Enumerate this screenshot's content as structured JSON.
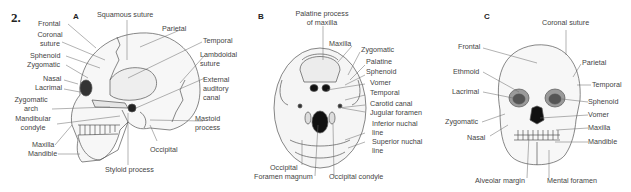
{
  "figure_number": "2.",
  "panels": {
    "A": {
      "letter": "A",
      "labels": {
        "squamous_suture": "Squamous suture",
        "frontal": "Frontal",
        "coronal_suture_1": "Coronal",
        "coronal_suture_2": "suture",
        "parietal": "Parietal",
        "temporal": "Temporal",
        "sphenoid": "Sphenoid",
        "zygomatic": "Zygomatic",
        "lambdoidal_1": "Lambdoidal",
        "lambdoidal_2": "suture",
        "nasal": "Nasal",
        "lacrimal": "Lacrimal",
        "external_1": "External",
        "external_2": "auditory",
        "external_3": "canal",
        "zyg_arch_1": "Zygomatic",
        "zyg_arch_2": "arch",
        "mand_condyle_1": "Mandibular",
        "mand_condyle_2": "condyle",
        "mastoid_1": "Mastoid",
        "mastoid_2": "process",
        "maxilla": "Maxilla",
        "mandible": "Mandible",
        "occipital": "Occipital",
        "styloid": "Styloid process"
      }
    },
    "B": {
      "letter": "B",
      "labels": {
        "palatine_process_1": "Palatine process",
        "palatine_process_2": "of maxilla",
        "maxilla": "Maxilla",
        "zygomatic": "Zygomatic",
        "palatine": "Palatine",
        "sphenoid": "Sphenoid",
        "vomer": "Vomer",
        "temporal": "Temporal",
        "carotid": "Carotid canal",
        "jugular": "Jugular foramen",
        "inferior_nuchal_1": "Inferior nuchal",
        "inferior_nuchal_2": "line",
        "superior_nuchal_1": "Superior nuchal",
        "superior_nuchal_2": "line",
        "occipital": "Occipital",
        "foramen_magnum": "Foramen magnum",
        "occipital_condyle": "Occipital condyle"
      }
    },
    "C": {
      "letter": "C",
      "labels": {
        "coronal_suture": "Coronal suture",
        "frontal": "Frontal",
        "parietal": "Parietal",
        "ethmoid": "Ethmoid",
        "temporal": "Temporal",
        "lacrimal": "Lacrimal",
        "sphenoid": "Sphenoid",
        "vomer": "Vomer",
        "zygomatic": "Zygomatic",
        "maxilla": "Maxilla",
        "nasal": "Nasal",
        "mandible": "Mandible",
        "alveolar_margin": "Alveolar margin",
        "mental_foramen": "Mental foramen"
      }
    }
  },
  "colors": {
    "line": "#555555",
    "bone": "#f4f4f4",
    "shade": "#bdbdbd",
    "dark": "#1a1a1a"
  }
}
